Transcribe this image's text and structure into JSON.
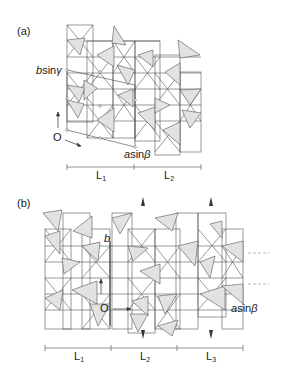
{
  "panels": [
    {
      "id": "a",
      "label": "(a)",
      "axis_labels": {
        "b": "b",
        "b_trig": "sin",
        "b_angle": "γ",
        "a": "a",
        "a_trig": "sin",
        "a_angle": "β",
        "origin": "O"
      },
      "scale_segments": [
        {
          "name": "L",
          "sub": "1"
        },
        {
          "name": "L",
          "sub": "2"
        }
      ]
    },
    {
      "id": "b",
      "label": "(b)",
      "axis_labels": {
        "b": "b",
        "a": "a",
        "a_trig": "sin",
        "a_angle": "β",
        "origin": "O"
      },
      "scale_segments": [
        {
          "name": "L",
          "sub": "1"
        },
        {
          "name": "L",
          "sub": "2"
        },
        {
          "name": "L",
          "sub": "3"
        }
      ]
    }
  ],
  "colors": {
    "line": "#555555",
    "fill": "#e2e2e2",
    "dashed": "#999999"
  }
}
